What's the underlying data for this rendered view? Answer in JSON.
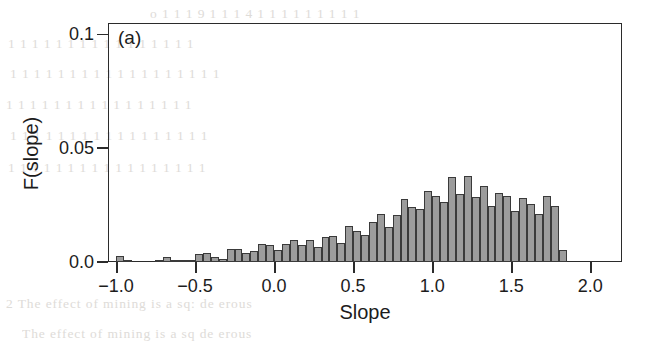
{
  "figure": {
    "panel_label": "(a)",
    "background_noise_text": [
      "o  1  1  1  9  1  1  1  4  1  1  1  1  1  1  1  1  1",
      "1  1  1  1   1   1  1  1  1   1  1   1   1  1  1  1",
      "1  1  1  1  1  1  1  1  1  1  1  1  1  1  1  1  1  1",
      "1   1  1  1   1   1  1  1  1  1  1  1  1  1  1   1",
      "1  1  1  1  1  1  1   1  1  1  1  1  1  1  1  1  1",
      "1  1  1  1  1  1  1  1  1  1  1  1  1  1  1  1  1",
      "2  The effect of mining is a sq: de  erous",
      "The effect of mining is a sq  de  erous"
    ]
  },
  "chart_data": {
    "type": "bar",
    "title": "",
    "subtitle": "",
    "panel": "(a)",
    "xlabel": "Slope",
    "ylabel": "F(slope)",
    "xlim": [
      -1.05,
      2.2
    ],
    "ylim": [
      0.0,
      0.105
    ],
    "xticks": [
      -1.0,
      -0.5,
      0.0,
      0.5,
      1.0,
      1.5,
      2.0
    ],
    "xticklabels": [
      "-1.0",
      "-0.5",
      "0.0",
      "0.5",
      "1.0",
      "1.5",
      "2.0"
    ],
    "yticks": [
      0.0,
      0.05,
      0.1
    ],
    "yticklabels": [
      "0.0",
      "0.05",
      "0.1"
    ],
    "grid": false,
    "legend": null,
    "bar_width": 0.05,
    "bar_fill_color": "#9c9c9c",
    "bar_edge_color": "#3a3a3a",
    "bin_left_edges": [
      -1.0,
      -0.95,
      -0.9,
      -0.85,
      -0.8,
      -0.75,
      -0.7,
      -0.65,
      -0.6,
      -0.55,
      -0.5,
      -0.45,
      -0.4,
      -0.35,
      -0.3,
      -0.25,
      -0.2,
      -0.15,
      -0.1,
      -0.05,
      0.0,
      0.05,
      0.1,
      0.15,
      0.2,
      0.25,
      0.3,
      0.35,
      0.4,
      0.45,
      0.5,
      0.55,
      0.6,
      0.65,
      0.7,
      0.75,
      0.8,
      0.85,
      0.9,
      0.95,
      1.0,
      1.05,
      1.1,
      1.15,
      1.2,
      1.25,
      1.3,
      1.35,
      1.4,
      1.45,
      1.5,
      1.55,
      1.6,
      1.65,
      1.7,
      1.75,
      1.8
    ],
    "values": [
      0.0025,
      0.0008,
      0.0,
      0.0,
      0.0,
      0.0008,
      0.002,
      0.0008,
      0.001,
      0.0008,
      0.0035,
      0.0038,
      0.0022,
      0.0012,
      0.0055,
      0.0058,
      0.0038,
      0.0048,
      0.0078,
      0.0075,
      0.0052,
      0.008,
      0.0095,
      0.0075,
      0.0098,
      0.0068,
      0.011,
      0.0115,
      0.0085,
      0.016,
      0.0135,
      0.0118,
      0.0175,
      0.021,
      0.0155,
      0.0205,
      0.0275,
      0.024,
      0.0235,
      0.031,
      0.0288,
      0.0265,
      0.0375,
      0.03,
      0.038,
      0.0285,
      0.0335,
      0.0245,
      0.0305,
      0.029,
      0.0225,
      0.028,
      0.0255,
      0.021,
      0.029,
      0.0245,
      0.0052
    ]
  }
}
